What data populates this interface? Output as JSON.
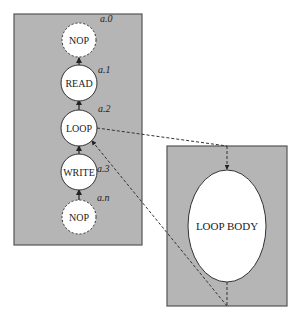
{
  "diagram": {
    "colors": {
      "panel_fill": "#b5b5b5",
      "panel_stroke": "#555555",
      "node_fill": "#ffffff",
      "line": "#333333"
    },
    "main_sequence": {
      "nodes": [
        {
          "id": "a0",
          "text": "NOP",
          "label": "a.0",
          "style": "dashed"
        },
        {
          "id": "a1",
          "text": "READ",
          "label": "a.1",
          "style": "solid"
        },
        {
          "id": "a2",
          "text": "LOOP",
          "label": "a.2",
          "style": "solid"
        },
        {
          "id": "a3",
          "text": "WRITE",
          "label": "a.3",
          "style": "solid"
        },
        {
          "id": "an",
          "text": "NOP",
          "label": "a.n",
          "style": "dashed"
        }
      ]
    },
    "loop_body": {
      "text": "LOOP BODY"
    }
  }
}
